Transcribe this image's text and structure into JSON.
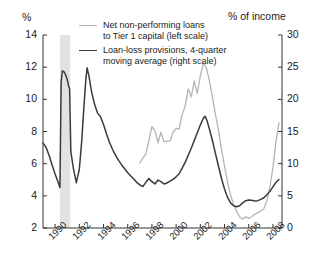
{
  "chart_data": {
    "type": "line",
    "title": "",
    "xlabel": "",
    "left_axis": {
      "label": "%",
      "ticks": [
        2,
        4,
        6,
        8,
        10,
        12,
        14
      ],
      "ylim": [
        2,
        14
      ]
    },
    "right_axis": {
      "label": "% of income",
      "ticks": [
        0,
        5,
        10,
        15,
        20,
        25,
        30
      ],
      "ylim": [
        0,
        30
      ]
    },
    "xlim": [
      1989,
      2008.75
    ],
    "xticks": [
      1990,
      1992,
      1994,
      1996,
      1998,
      2000,
      2002,
      2004,
      2006,
      2008
    ],
    "xtick_labels": [
      "1990",
      "1992",
      "1994",
      "1996",
      "1998",
      "2000",
      "2002",
      "2004",
      "2006",
      "2008"
    ],
    "grid": false,
    "legend_position": "top-center",
    "shaded_regions": [
      {
        "name": "recession-band",
        "x_start": 1990.4,
        "x_end": 1991.25,
        "color": "#e2e2e2"
      }
    ],
    "series": [
      {
        "name": "Net non-performing loans to Tier 1 capital (left scale)",
        "axis": "left",
        "color": "#b5b5b5",
        "width": 1.3,
        "points": [
          [
            1997.0,
            6.05
          ],
          [
            1997.25,
            6.35
          ],
          [
            1997.5,
            6.6
          ],
          [
            1997.75,
            7.45
          ],
          [
            1998.0,
            8.3
          ],
          [
            1998.25,
            8.05
          ],
          [
            1998.5,
            7.3
          ],
          [
            1998.75,
            7.95
          ],
          [
            1999.0,
            7.35
          ],
          [
            1999.25,
            7.4
          ],
          [
            1999.5,
            7.4
          ],
          [
            1999.75,
            7.95
          ],
          [
            2000.0,
            8.2
          ],
          [
            2000.25,
            8.15
          ],
          [
            2000.5,
            9.05
          ],
          [
            2000.75,
            9.6
          ],
          [
            2001.0,
            10.65
          ],
          [
            2001.25,
            10.15
          ],
          [
            2001.5,
            11.15
          ],
          [
            2001.75,
            10.35
          ],
          [
            2002.0,
            11.45
          ],
          [
            2002.25,
            12.25
          ],
          [
            2002.5,
            11.95
          ],
          [
            2002.75,
            11.15
          ],
          [
            2003.0,
            10.15
          ],
          [
            2003.25,
            9.05
          ],
          [
            2003.5,
            8.1
          ],
          [
            2003.75,
            6.9
          ],
          [
            2004.0,
            5.85
          ],
          [
            2004.25,
            4.85
          ],
          [
            2004.5,
            4.05
          ],
          [
            2004.75,
            3.45
          ],
          [
            2005.0,
            3.05
          ],
          [
            2005.25,
            2.7
          ],
          [
            2005.5,
            2.55
          ],
          [
            2005.75,
            2.7
          ],
          [
            2006.0,
            2.6
          ],
          [
            2006.25,
            2.7
          ],
          [
            2006.5,
            2.85
          ],
          [
            2006.75,
            2.95
          ],
          [
            2007.0,
            3.05
          ],
          [
            2007.25,
            3.2
          ],
          [
            2007.5,
            3.7
          ],
          [
            2007.75,
            4.55
          ],
          [
            2008.0,
            5.75
          ],
          [
            2008.25,
            7.35
          ],
          [
            2008.5,
            8.55
          ]
        ]
      },
      {
        "name": "Loan-loss provisions, 4-quarter moving average (right scale)",
        "axis": "right",
        "color": "#3a3a3a",
        "width": 1.5,
        "points": [
          [
            1989.0,
            13.2
          ],
          [
            1989.25,
            12.55
          ],
          [
            1989.5,
            11.3
          ],
          [
            1989.75,
            9.8
          ],
          [
            1990.0,
            8.4
          ],
          [
            1990.25,
            7.1
          ],
          [
            1990.4,
            6.3
          ],
          [
            1990.5,
            22.7
          ],
          [
            1990.6,
            24.4
          ],
          [
            1990.75,
            24.25
          ],
          [
            1990.85,
            23.9
          ],
          [
            1991.0,
            23.1
          ],
          [
            1991.1,
            22.2
          ],
          [
            1991.2,
            21.6
          ],
          [
            1991.3,
            11.9
          ],
          [
            1991.5,
            9.4
          ],
          [
            1991.75,
            7.05
          ],
          [
            1992.0,
            9.1
          ],
          [
            1992.2,
            13.5
          ],
          [
            1992.4,
            19.4
          ],
          [
            1992.55,
            23.3
          ],
          [
            1992.65,
            24.9
          ],
          [
            1992.8,
            23.6
          ],
          [
            1993.0,
            21.3
          ],
          [
            1993.25,
            19.3
          ],
          [
            1993.5,
            17.9
          ],
          [
            1993.75,
            17.3
          ],
          [
            1994.0,
            16.1
          ],
          [
            1994.25,
            14.6
          ],
          [
            1994.5,
            13.3
          ],
          [
            1994.75,
            12.2
          ],
          [
            1995.0,
            11.3
          ],
          [
            1995.25,
            10.5
          ],
          [
            1995.5,
            9.8
          ],
          [
            1995.75,
            9.2
          ],
          [
            1996.0,
            8.6
          ],
          [
            1996.25,
            8.1
          ],
          [
            1996.5,
            7.6
          ],
          [
            1996.75,
            7.1
          ],
          [
            1997.0,
            6.7
          ],
          [
            1997.25,
            6.45
          ],
          [
            1997.5,
            7.1
          ],
          [
            1997.75,
            7.7
          ],
          [
            1998.0,
            7.2
          ],
          [
            1998.25,
            6.85
          ],
          [
            1998.5,
            7.45
          ],
          [
            1998.75,
            7.2
          ],
          [
            1999.0,
            6.85
          ],
          [
            1999.25,
            7.0
          ],
          [
            1999.5,
            7.3
          ],
          [
            1999.75,
            7.55
          ],
          [
            2000.0,
            7.95
          ],
          [
            2000.25,
            8.45
          ],
          [
            2000.5,
            9.3
          ],
          [
            2000.75,
            10.2
          ],
          [
            2001.0,
            11.3
          ],
          [
            2001.25,
            12.4
          ],
          [
            2001.5,
            13.6
          ],
          [
            2001.75,
            14.8
          ],
          [
            2002.0,
            16.0
          ],
          [
            2002.25,
            17.05
          ],
          [
            2002.4,
            17.35
          ],
          [
            2002.55,
            16.7
          ],
          [
            2002.75,
            15.4
          ],
          [
            2003.0,
            13.6
          ],
          [
            2003.25,
            11.6
          ],
          [
            2003.5,
            9.6
          ],
          [
            2003.75,
            7.7
          ],
          [
            2004.0,
            6.05
          ],
          [
            2004.25,
            4.75
          ],
          [
            2004.5,
            3.9
          ],
          [
            2004.75,
            3.45
          ],
          [
            2005.0,
            3.3
          ],
          [
            2005.25,
            3.45
          ],
          [
            2005.5,
            3.9
          ],
          [
            2005.75,
            4.25
          ],
          [
            2006.0,
            4.35
          ],
          [
            2006.25,
            4.3
          ],
          [
            2006.5,
            4.2
          ],
          [
            2006.75,
            4.25
          ],
          [
            2007.0,
            4.45
          ],
          [
            2007.25,
            4.7
          ],
          [
            2007.5,
            5.15
          ],
          [
            2007.75,
            5.7
          ],
          [
            2008.0,
            6.4
          ],
          [
            2008.25,
            7.1
          ],
          [
            2008.5,
            7.55
          ]
        ]
      }
    ]
  },
  "legend": {
    "items": [
      {
        "line1": "Net non-performing loans",
        "line2": "to Tier 1 capital (left scale)",
        "color": "#b5b5b5",
        "thickness": "1.3px"
      },
      {
        "line1": "Loan-loss provisions, 4-quarter",
        "line2": "moving average (right scale)",
        "color": "#3a3a3a",
        "thickness": "1.9px"
      }
    ]
  }
}
